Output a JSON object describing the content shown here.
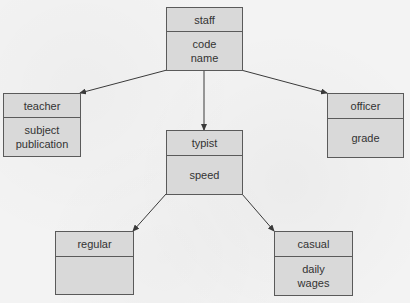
{
  "diagram": {
    "type": "class-hierarchy",
    "classes": [
      {
        "id": "staff",
        "name": "staff",
        "attributes": [
          "code",
          "name"
        ]
      },
      {
        "id": "teacher",
        "name": "teacher",
        "attributes": [
          "subject",
          "publication"
        ]
      },
      {
        "id": "typist",
        "name": "typist",
        "attributes": [
          "speed"
        ]
      },
      {
        "id": "officer",
        "name": "officer",
        "attributes": [
          "grade"
        ]
      },
      {
        "id": "regular",
        "name": "regular",
        "attributes": []
      },
      {
        "id": "casual",
        "name": "casual",
        "attributes": [
          "daily",
          "wages"
        ]
      }
    ],
    "edges": [
      {
        "from": "staff",
        "to": "teacher"
      },
      {
        "from": "staff",
        "to": "typist"
      },
      {
        "from": "staff",
        "to": "officer"
      },
      {
        "from": "typist",
        "to": "regular"
      },
      {
        "from": "typist",
        "to": "casual"
      }
    ],
    "colors": {
      "box_fill": "#d9d9d9",
      "border": "#5a5a5a",
      "background": "#f2f2f2",
      "arrow": "#3a3a3a"
    }
  }
}
